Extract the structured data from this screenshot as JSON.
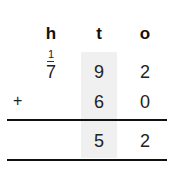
{
  "columns": [
    {
      "key": "h",
      "label": "h"
    },
    {
      "key": "t",
      "label": "t"
    },
    {
      "key": "o",
      "label": "o"
    }
  ],
  "carry": {
    "h": "1"
  },
  "row1": {
    "h": "7",
    "t": "9",
    "o": "2"
  },
  "row2": {
    "operator": "+",
    "t": "6",
    "o": "0"
  },
  "result": {
    "t": "5",
    "o": "2"
  },
  "colors": {
    "shade": "#f0f0f0",
    "rule": "#111111"
  }
}
